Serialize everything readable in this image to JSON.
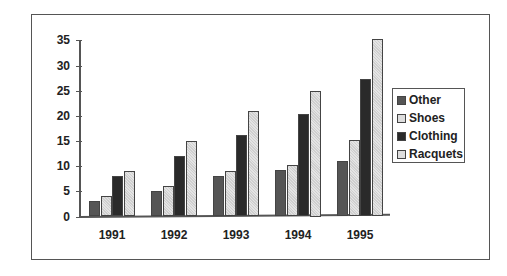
{
  "chart_data": {
    "type": "bar",
    "title": "",
    "xlabel": "",
    "ylabel": "",
    "categories": [
      "1991",
      "1992",
      "1993",
      "1994",
      "1995"
    ],
    "series": [
      {
        "name": "Other",
        "color": "#555555",
        "values": [
          3,
          5,
          8,
          9.3,
          11
        ]
      },
      {
        "name": "Shoes",
        "color": "#c8c8c8",
        "values": [
          4,
          6,
          9,
          10.3,
          15.3
        ]
      },
      {
        "name": "Clothing",
        "color": "#2a2a2a",
        "values": [
          8,
          12,
          16.3,
          20.3,
          27.3
        ]
      },
      {
        "name": "Racquets",
        "color": "#d4d4d4",
        "values": [
          9,
          15,
          21,
          25,
          35.3
        ]
      }
    ],
    "ylim": [
      0,
      35
    ],
    "yticks": [
      "0",
      "5",
      "10",
      "15",
      "20",
      "25",
      "30",
      "35"
    ],
    "grid": false,
    "legend_position": "right"
  },
  "legend": {
    "items": [
      "Other",
      "Shoes",
      "Clothing",
      "Racquets"
    ]
  }
}
